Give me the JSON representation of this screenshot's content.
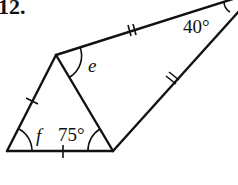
{
  "problem": {
    "number": "12."
  },
  "figure": {
    "stroke_color": "#111111",
    "vertices": {
      "bottom_left": [
        7,
        151
      ],
      "bottom_right": [
        113,
        151
      ],
      "apex": [
        56,
        55
      ],
      "far_right": [
        233,
        -2
      ]
    },
    "angles": {
      "far_right_angle": "40°",
      "apex_angle_var": "e",
      "bottom_left_angle_var": "f",
      "bottom_right_angle": "75°"
    },
    "tick_marks": {
      "left_side": "single",
      "bottom_side": "single",
      "top_side": "double",
      "right_side": "double"
    }
  }
}
